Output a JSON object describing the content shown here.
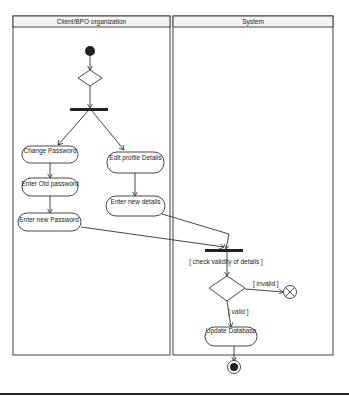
{
  "diagram": {
    "type": "uml-activity-diagram",
    "swimlanes": [
      {
        "id": "client",
        "title": "Client/BPO organization"
      },
      {
        "id": "system",
        "title": "System"
      }
    ],
    "actions": {
      "change_password": "Change Password",
      "enter_old_password": "Enter Old password",
      "enter_new_password": "Enter new Password",
      "edit_profile": "Edit profile Details",
      "enter_new_details": "Enter new details",
      "update_database": "Update Database"
    },
    "guards": {
      "check_validity": "[ check validity of details ]",
      "invalid": "[ invalid ]",
      "valid": "[ valid ]"
    },
    "colors": {
      "line": "#333333",
      "node_fill": "#ffffff",
      "bar": "#222222"
    }
  }
}
